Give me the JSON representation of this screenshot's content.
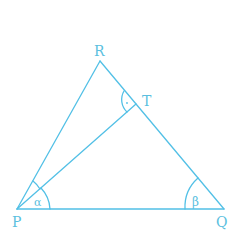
{
  "diagram": {
    "colors": {
      "line": "#52c0e6",
      "label": "#5bbfe0",
      "background": "#ffffff"
    },
    "points": {
      "R": {
        "label": "R",
        "x": 100,
        "y": 61
      },
      "T": {
        "label": "T",
        "x": 136,
        "y": 104
      },
      "P": {
        "label": "P",
        "x": 17,
        "y": 209
      },
      "Q": {
        "label": "Q",
        "x": 224,
        "y": 209
      }
    },
    "angles": {
      "alpha": {
        "label": "α",
        "at": "P"
      },
      "beta": {
        "label": "β",
        "at": "Q"
      },
      "right_angle_dot": {
        "label": "·",
        "at": "T"
      }
    },
    "segments": [
      "PR",
      "RQ",
      "PQ",
      "PT"
    ]
  }
}
